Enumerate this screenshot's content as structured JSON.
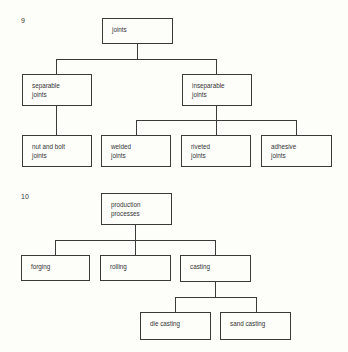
{
  "figures": [
    {
      "number": "9",
      "root": {
        "lines": [
          "joints"
        ]
      },
      "level1": [
        {
          "lines": [
            "separable",
            "joints"
          ]
        },
        {
          "lines": [
            "inseparable",
            "joints"
          ]
        }
      ],
      "level2": [
        {
          "lines": [
            "nut and bolt",
            "joints"
          ],
          "parent": "separable joints"
        },
        {
          "lines": [
            "welded",
            "joints"
          ],
          "parent": "inseparable joints"
        },
        {
          "lines": [
            "riveted",
            "joints"
          ],
          "parent": "inseparable joints"
        },
        {
          "lines": [
            "adhesive",
            "joints"
          ],
          "parent": "inseparable joints"
        }
      ]
    },
    {
      "number": "10",
      "root": {
        "lines": [
          "production",
          "processes"
        ]
      },
      "level1": [
        {
          "lines": [
            "forging"
          ]
        },
        {
          "lines": [
            "rolling"
          ]
        },
        {
          "lines": [
            "casting"
          ]
        }
      ],
      "level2": [
        {
          "lines": [
            "die casting"
          ],
          "parent": "casting"
        },
        {
          "lines": [
            "sand casting"
          ],
          "parent": "casting"
        }
      ]
    }
  ],
  "colors": {
    "background": "#fdfdfa",
    "line": "#3a3a3a",
    "text": "#333333"
  }
}
